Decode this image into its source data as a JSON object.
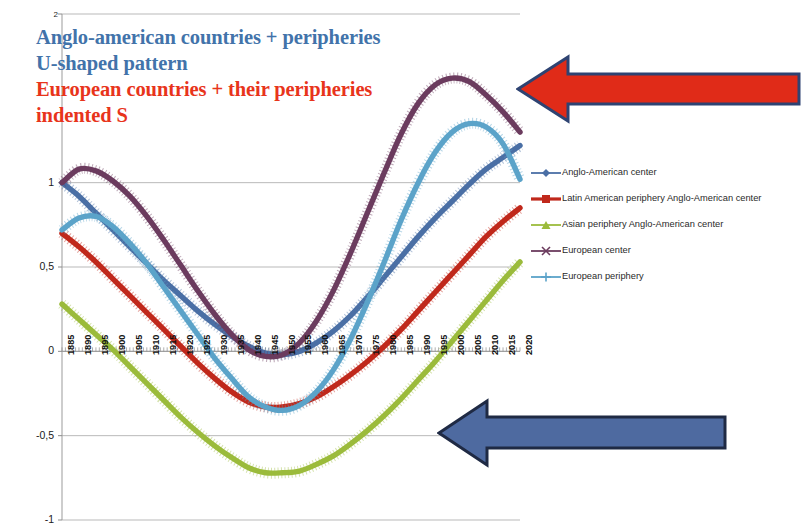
{
  "annotations": {
    "anglo_note_lines": [
      "Anglo-american countries + peripheries",
      "U-shaped pattern"
    ],
    "anglo_note_line1": "Anglo-american countries + peripheries",
    "anglo_note_line2": "U-shaped pattern",
    "euro_note_line1": "European countries + their peripheries",
    "euro_note_line2": "indented S",
    "anglo_color": "#4273AA",
    "euro_color": "#E8341B",
    "red_arrow": {
      "name": "red-left-arrow",
      "direction": "left",
      "fill": "#E02B18",
      "stroke": "#2E4372"
    },
    "blue_arrow": {
      "name": "blue-left-arrow",
      "direction": "left",
      "fill": "#4E6AA0",
      "stroke": "#1F2A44"
    }
  },
  "legend": {
    "position": "right",
    "items": [
      {
        "label": "Anglo-American center",
        "color": "#4A6FA5",
        "marker": "diamond"
      },
      {
        "label": "Latin American periphery Anglo-American center",
        "color": "#C0281B",
        "marker": "square"
      },
      {
        "label": "Asian periphery Anglo-American center",
        "color": "#9BBB3B",
        "marker": "triangle"
      },
      {
        "label": "European center",
        "color": "#6B3B5E",
        "marker": "cross"
      },
      {
        "label": "European periphery",
        "color": "#5BA3C9",
        "marker": "plus"
      }
    ]
  },
  "chart_data": {
    "type": "line",
    "title": "",
    "xlabel": "",
    "ylabel": "",
    "ylim": [
      -1,
      2
    ],
    "yticks": [
      2,
      1,
      0.5,
      0,
      -0.5,
      -1
    ],
    "ytick_labels": [
      "2",
      "1",
      "0,5",
      "0",
      "-0,5",
      "-1"
    ],
    "xlim": [
      1885,
      2020
    ],
    "grid": true,
    "xticks": [
      1885,
      1890,
      1895,
      1900,
      1905,
      1910,
      1915,
      1920,
      1925,
      1930,
      1935,
      1940,
      1945,
      1950,
      1955,
      1960,
      1965,
      1970,
      1975,
      1980,
      1985,
      1990,
      1995,
      2000,
      2005,
      2010,
      2015,
      2020
    ],
    "xtick_labels": [
      "1885",
      "1890",
      "1895",
      "1900",
      "1905",
      "1910",
      "1915",
      "1920",
      "1925",
      "1930",
      "1935",
      "1940",
      "1945",
      "1950",
      "1955",
      "1960",
      "1965",
      "1970",
      "1975",
      "1980",
      "1985",
      "1990",
      "1995",
      "2000",
      "2005",
      "2010",
      "2015",
      "2020"
    ],
    "x": [
      1885,
      1890,
      1895,
      1900,
      1905,
      1910,
      1915,
      1920,
      1925,
      1930,
      1935,
      1940,
      1945,
      1950,
      1955,
      1960,
      1965,
      1970,
      1975,
      1980,
      1985,
      1990,
      1995,
      2000,
      2005,
      2010,
      2015,
      2020
    ],
    "series": [
      {
        "name": "Anglo-American center",
        "color": "#4A6FA5",
        "values": [
          1.0,
          0.92,
          0.82,
          0.72,
          0.62,
          0.52,
          0.42,
          0.33,
          0.24,
          0.16,
          0.09,
          0.03,
          -0.01,
          -0.02,
          0.0,
          0.05,
          0.12,
          0.21,
          0.32,
          0.44,
          0.56,
          0.68,
          0.79,
          0.89,
          0.99,
          1.08,
          1.15,
          1.22
        ]
      },
      {
        "name": "Latin American periphery Anglo-American center",
        "color": "#C0281B",
        "values": [
          0.7,
          0.62,
          0.53,
          0.43,
          0.33,
          0.23,
          0.13,
          0.03,
          -0.07,
          -0.16,
          -0.24,
          -0.3,
          -0.33,
          -0.33,
          -0.31,
          -0.27,
          -0.21,
          -0.14,
          -0.06,
          0.03,
          0.13,
          0.24,
          0.35,
          0.46,
          0.57,
          0.68,
          0.77,
          0.85
        ]
      },
      {
        "name": "Asian periphery Anglo-American center",
        "color": "#9BBB3B",
        "values": [
          0.28,
          0.19,
          0.1,
          0.01,
          -0.09,
          -0.19,
          -0.29,
          -0.39,
          -0.48,
          -0.56,
          -0.63,
          -0.69,
          -0.72,
          -0.72,
          -0.71,
          -0.67,
          -0.62,
          -0.55,
          -0.47,
          -0.38,
          -0.28,
          -0.17,
          -0.06,
          0.06,
          0.18,
          0.3,
          0.42,
          0.53
        ]
      },
      {
        "name": "European center",
        "color": "#6B3B5E",
        "values": [
          1.0,
          1.08,
          1.07,
          1.01,
          0.92,
          0.8,
          0.66,
          0.51,
          0.36,
          0.22,
          0.1,
          0.01,
          -0.03,
          -0.02,
          0.05,
          0.18,
          0.36,
          0.58,
          0.82,
          1.06,
          1.29,
          1.47,
          1.58,
          1.62,
          1.6,
          1.52,
          1.42,
          1.3
        ]
      },
      {
        "name": "European periphery",
        "color": "#5BA3C9",
        "values": [
          0.72,
          0.79,
          0.8,
          0.74,
          0.64,
          0.52,
          0.38,
          0.24,
          0.1,
          -0.04,
          -0.16,
          -0.27,
          -0.33,
          -0.35,
          -0.32,
          -0.24,
          -0.11,
          0.07,
          0.29,
          0.53,
          0.78,
          1.0,
          1.18,
          1.3,
          1.35,
          1.33,
          1.23,
          1.02
        ]
      }
    ]
  }
}
